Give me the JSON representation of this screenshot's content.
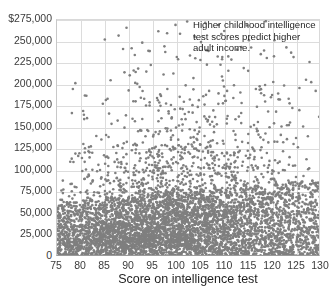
{
  "chart_data": {
    "type": "scatter",
    "title": "",
    "subtitle": "",
    "xlabel": "Score on intelligence test",
    "ylabel": "",
    "xlim": [
      75,
      130
    ],
    "ylim": [
      0,
      275000
    ],
    "grid": true,
    "legend": null,
    "point_color": "#7f7f7f",
    "point_size_px": 2.6,
    "n_points": 2400,
    "annotations": [
      {
        "text": "Higher childhood intelligence test scores predict higher adult income.",
        "lines": [
          "Higher childhood intelligence",
          "test scores predict higher",
          "adult income."
        ],
        "x": 108,
        "y": 268000
      }
    ],
    "xticks": [
      75,
      80,
      85,
      90,
      95,
      100,
      105,
      110,
      115,
      120,
      125,
      130
    ],
    "xticklabels": [
      "75",
      "80",
      "85",
      "90",
      "95",
      "100",
      "105",
      "110",
      "115",
      "120",
      "125",
      "130"
    ],
    "yticks": [
      0,
      25000,
      50000,
      75000,
      100000,
      125000,
      150000,
      175000,
      200000,
      225000,
      250000,
      275000
    ],
    "yticklabels": [
      "0",
      "25,000",
      "50,000",
      "75,000",
      "100,000",
      "125,000",
      "150,000",
      "175,000",
      "200,000",
      "225,000",
      "250,000",
      "$275,000"
    ],
    "distribution_bins": [
      {
        "score": 76,
        "median_income": 33000,
        "p90_income": 96000,
        "count": 38
      },
      {
        "score": 78,
        "median_income": 34000,
        "p90_income": 101000,
        "count": 52
      },
      {
        "score": 80,
        "median_income": 35000,
        "p90_income": 104000,
        "count": 70
      },
      {
        "score": 82,
        "median_income": 36000,
        "p90_income": 110000,
        "count": 88
      },
      {
        "score": 84,
        "median_income": 37000,
        "p90_income": 114000,
        "count": 104
      },
      {
        "score": 86,
        "median_income": 38000,
        "p90_income": 118000,
        "count": 120
      },
      {
        "score": 88,
        "median_income": 39500,
        "p90_income": 122000,
        "count": 138
      },
      {
        "score": 90,
        "median_income": 41000,
        "p90_income": 126000,
        "count": 152
      },
      {
        "score": 92,
        "median_income": 42000,
        "p90_income": 131000,
        "count": 164
      },
      {
        "score": 94,
        "median_income": 43500,
        "p90_income": 136000,
        "count": 172
      },
      {
        "score": 96,
        "median_income": 45000,
        "p90_income": 141000,
        "count": 178
      },
      {
        "score": 98,
        "median_income": 46500,
        "p90_income": 146000,
        "count": 180
      },
      {
        "score": 100,
        "median_income": 48000,
        "p90_income": 150000,
        "count": 178
      },
      {
        "score": 102,
        "median_income": 49500,
        "p90_income": 155000,
        "count": 172
      },
      {
        "score": 104,
        "median_income": 51000,
        "p90_income": 160000,
        "count": 164
      },
      {
        "score": 106,
        "median_income": 52500,
        "p90_income": 165000,
        "count": 152
      },
      {
        "score": 108,
        "median_income": 54000,
        "p90_income": 170000,
        "count": 138
      },
      {
        "score": 110,
        "median_income": 55500,
        "p90_income": 175000,
        "count": 124
      },
      {
        "score": 112,
        "median_income": 57000,
        "p90_income": 180000,
        "count": 110
      },
      {
        "score": 114,
        "median_income": 58500,
        "p90_income": 186000,
        "count": 96
      },
      {
        "score": 116,
        "median_income": 60000,
        "p90_income": 191000,
        "count": 82
      },
      {
        "score": 118,
        "median_income": 61500,
        "p90_income": 196000,
        "count": 70
      },
      {
        "score": 120,
        "median_income": 63000,
        "p90_income": 201000,
        "count": 58
      },
      {
        "score": 122,
        "median_income": 64500,
        "p90_income": 207000,
        "count": 48
      },
      {
        "score": 124,
        "median_income": 66000,
        "p90_income": 212000,
        "count": 40
      },
      {
        "score": 126,
        "median_income": 67500,
        "p90_income": 218000,
        "count": 32
      },
      {
        "score": 128,
        "median_income": 69000,
        "p90_income": 224000,
        "count": 26
      },
      {
        "score": 130,
        "median_income": 70500,
        "p90_income": 230000,
        "count": 18
      }
    ]
  }
}
